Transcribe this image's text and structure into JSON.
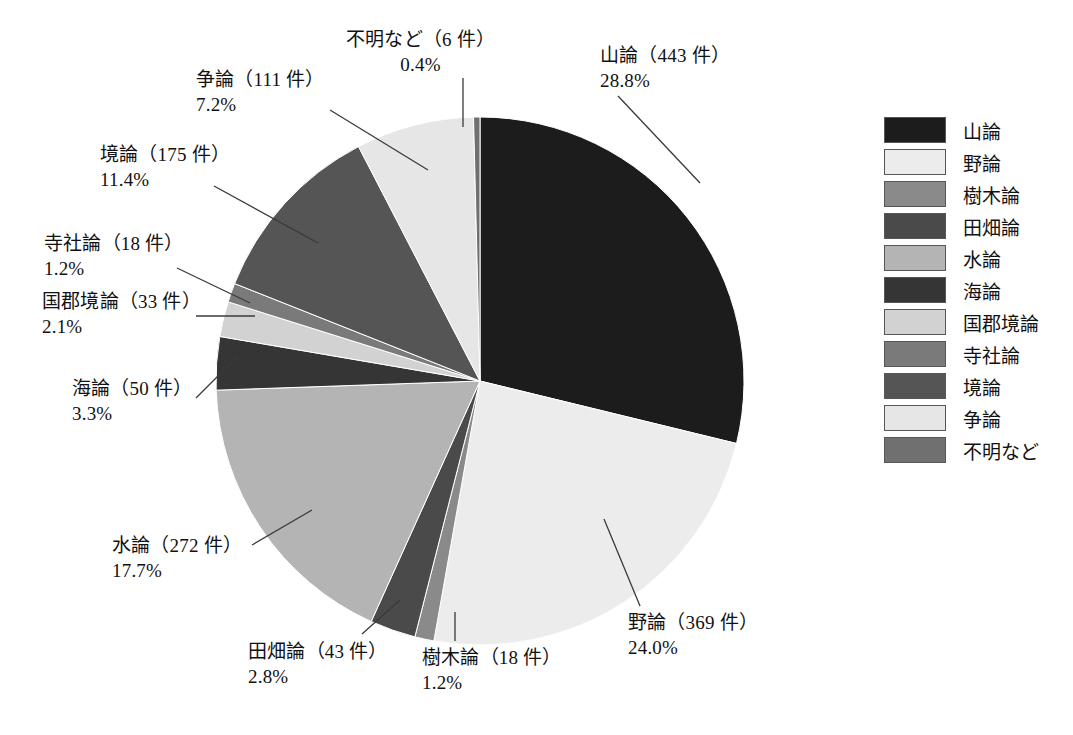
{
  "chart_data": {
    "type": "pie",
    "title": "",
    "subtitle": "",
    "xlabel": "",
    "ylabel": "",
    "unit_suffix": "件",
    "legend_position": "right",
    "grid": false,
    "total_count": 1538,
    "categories": [
      "山論",
      "野論",
      "樹木論",
      "田畑論",
      "水論",
      "海論",
      "国郡境論",
      "寺社論",
      "境論",
      "争論",
      "不明など"
    ],
    "values": [
      443,
      369,
      18,
      43,
      272,
      50,
      33,
      18,
      175,
      111,
      6
    ],
    "percents": [
      28.8,
      24.0,
      1.2,
      2.8,
      17.7,
      3.3,
      2.1,
      1.2,
      11.4,
      7.2,
      0.4
    ],
    "colors": [
      "#1c1c1c",
      "#ececec",
      "#8a8a8a",
      "#4a4a4a",
      "#b4b4b4",
      "#353535",
      "#d2d2d2",
      "#7a7a7a",
      "#555555",
      "#e6e6e6",
      "#707070"
    ],
    "slices": [
      {
        "name": "山論",
        "count": 443,
        "percent": 28.8,
        "color": "#1c1c1c"
      },
      {
        "name": "野論",
        "count": 369,
        "percent": 24.0,
        "color": "#ececec"
      },
      {
        "name": "樹木論",
        "count": 18,
        "percent": 1.2,
        "color": "#8a8a8a"
      },
      {
        "name": "田畑論",
        "count": 43,
        "percent": 2.8,
        "color": "#4a4a4a"
      },
      {
        "name": "水論",
        "count": 272,
        "percent": 17.7,
        "color": "#b4b4b4"
      },
      {
        "name": "海論",
        "count": 50,
        "percent": 3.3,
        "color": "#353535"
      },
      {
        "name": "国郡境論",
        "count": 33,
        "percent": 2.1,
        "color": "#d2d2d2"
      },
      {
        "name": "寺社論",
        "count": 18,
        "percent": 1.2,
        "color": "#7a7a7a"
      },
      {
        "name": "境論",
        "count": 175,
        "percent": 11.4,
        "color": "#555555"
      },
      {
        "name": "争論",
        "count": 111,
        "percent": 7.2,
        "color": "#e6e6e6"
      },
      {
        "name": "不明など",
        "count": 6,
        "percent": 0.4,
        "color": "#707070"
      }
    ]
  },
  "callouts": [
    {
      "key": "fumei",
      "name": "不明など",
      "line1": "不明など（6 件）",
      "line2": "0.4%"
    },
    {
      "key": "sanron",
      "name": "山論",
      "line1": "山論（443 件）",
      "line2": "28.8%"
    },
    {
      "key": "souron",
      "name": "争論",
      "line1": "争論（111 件）",
      "line2": "7.2%"
    },
    {
      "key": "sakairon",
      "name": "境論",
      "line1": "境論（175 件）",
      "line2": "11.4%"
    },
    {
      "key": "jisharon",
      "name": "寺社論",
      "line1": "寺社論（18 件）",
      "line2": "1.2%"
    },
    {
      "key": "kokugun",
      "name": "国郡境論",
      "line1": "国郡境論（33 件）",
      "line2": "2.1%"
    },
    {
      "key": "kairon",
      "name": "海論",
      "line1": "海論（50 件）",
      "line2": "3.3%"
    },
    {
      "key": "suiron",
      "name": "水論",
      "line1": "水論（272 件）",
      "line2": "17.7%"
    },
    {
      "key": "tahata",
      "name": "田畑論",
      "line1": "田畑論（43 件）",
      "line2": "2.8%"
    },
    {
      "key": "jumoku",
      "name": "樹木論",
      "line1": "樹木論（18 件）",
      "line2": "1.2%"
    },
    {
      "key": "yaron",
      "name": "野論",
      "line1": "野論（369 件）",
      "line2": "24.0%"
    }
  ],
  "legend": {
    "items": [
      {
        "label": "山論",
        "color": "#1c1c1c"
      },
      {
        "label": "野論",
        "color": "#ececec"
      },
      {
        "label": "樹木論",
        "color": "#8a8a8a"
      },
      {
        "label": "田畑論",
        "color": "#4a4a4a"
      },
      {
        "label": "水論",
        "color": "#b4b4b4"
      },
      {
        "label": "海論",
        "color": "#353535"
      },
      {
        "label": "国郡境論",
        "color": "#d2d2d2"
      },
      {
        "label": "寺社論",
        "color": "#7a7a7a"
      },
      {
        "label": "境論",
        "color": "#555555"
      },
      {
        "label": "争論",
        "color": "#e6e6e6"
      },
      {
        "label": "不明など",
        "color": "#707070"
      }
    ]
  },
  "geometry": {
    "cx": 480,
    "cy": 381,
    "r": 264,
    "start_angle_deg": -90,
    "direction": "clockwise",
    "leader_color": "#3a3a3a"
  },
  "label_positions": [
    {
      "key": "fumei",
      "x": 346,
      "y": 28,
      "align": "center",
      "leader": [
        [
          463,
          78
        ],
        [
          463,
          127
        ]
      ]
    },
    {
      "key": "sanron",
      "x": 600,
      "y": 44,
      "align": "left",
      "leader": [
        [
          618,
          96
        ],
        [
          700,
          183
        ]
      ]
    },
    {
      "key": "souron",
      "x": 196,
      "y": 68,
      "align": "left",
      "leader": [
        [
          330,
          110
        ],
        [
          428,
          170
        ]
      ]
    },
    {
      "key": "sakairon",
      "x": 100,
      "y": 143,
      "align": "left",
      "leader": [
        [
          214,
          186
        ],
        [
          318,
          243
        ]
      ]
    },
    {
      "key": "jisharon",
      "x": 44,
      "y": 232,
      "align": "left",
      "leader": [
        [
          177,
          268
        ],
        [
          250,
          303
        ]
      ]
    },
    {
      "key": "kokugun",
      "x": 42,
      "y": 290,
      "align": "left",
      "leader": [
        [
          196,
          316
        ],
        [
          255,
          316
        ]
      ]
    },
    {
      "key": "kairon",
      "x": 72,
      "y": 377,
      "align": "left",
      "leader": [
        [
          196,
          398
        ],
        [
          238,
          356
        ]
      ]
    },
    {
      "key": "suiron",
      "x": 112,
      "y": 534,
      "align": "left",
      "leader": [
        [
          252,
          545
        ],
        [
          312,
          510
        ]
      ]
    },
    {
      "key": "tahata",
      "x": 248,
      "y": 640,
      "align": "left",
      "leader": [
        [
          362,
          634
        ],
        [
          400,
          600
        ]
      ]
    },
    {
      "key": "jumoku",
      "x": 422,
      "y": 646,
      "align": "left",
      "leader": [
        [
          455,
          641
        ],
        [
          455,
          612
        ]
      ]
    },
    {
      "key": "yaron",
      "x": 628,
      "y": 611,
      "align": "left",
      "leader": [
        [
          640,
          606
        ],
        [
          604,
          519
        ]
      ]
    }
  ]
}
